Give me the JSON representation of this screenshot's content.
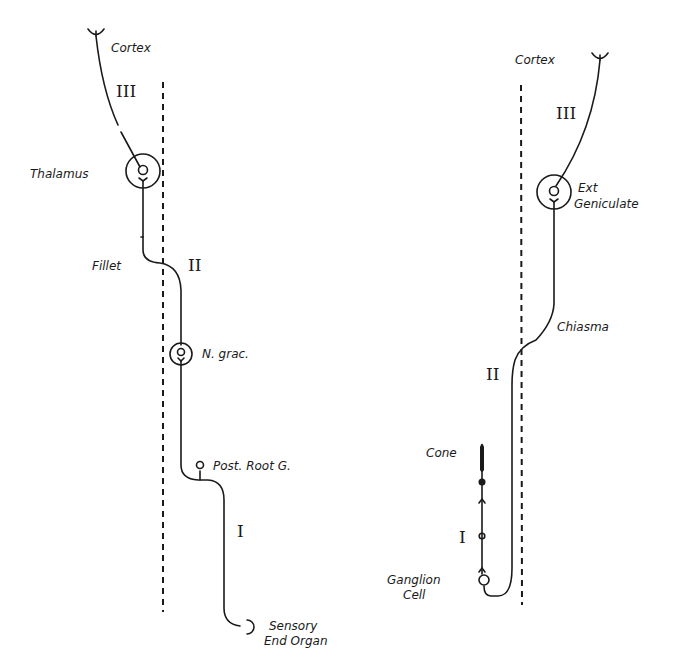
{
  "figure": {
    "page_marker": "",
    "left_pathway": {
      "title": "Somatic sensory pathway",
      "labels": {
        "cortex": "Cortex",
        "thalamus": "Thalamus",
        "fillet": "Fillet",
        "n_grac": "N. grac.",
        "post_root_g": "Post. Root G.",
        "sensory_line1": "Sensory",
        "sensory_line2": "End Organ"
      },
      "neuron_numbers": {
        "third": "III",
        "second": "II",
        "first": "I"
      }
    },
    "right_pathway": {
      "title": "Visual pathway",
      "labels": {
        "cortex": "Cortex",
        "ext_line1": "Ext",
        "ext_line2": "Geniculate",
        "chiasma": "Chiasma",
        "cone": "Cone",
        "ganglion_line1": "Ganglion",
        "ganglion_line2": "Cell"
      },
      "neuron_numbers": {
        "third": "III",
        "second": "II",
        "first": "I"
      }
    },
    "colors": {
      "ink": "#1a1a1a",
      "background": "#ffffff"
    }
  }
}
